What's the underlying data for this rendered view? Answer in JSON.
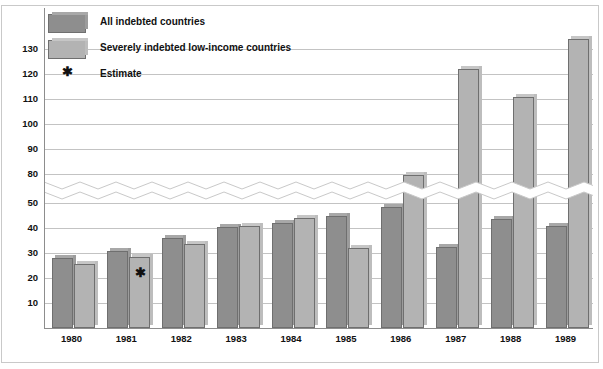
{
  "chart_data": {
    "type": "bar",
    "title": "",
    "subtitle": "",
    "xlabel": "",
    "ylabel": "",
    "categories": [
      "1980",
      "1981",
      "1982",
      "1983",
      "1984",
      "1985",
      "1986",
      "1987",
      "1988",
      "1989"
    ],
    "series": [
      {
        "name": "All indebted countries",
        "color": "#8e8e8e",
        "values": [
          28,
          31,
          36,
          40.5,
          42,
          45,
          48.5,
          51,
          43.5,
          41
        ]
      },
      {
        "name": "Severely indebted low-income countries",
        "color": "#b3b3b3",
        "values": [
          25.5,
          28.5,
          33.5,
          41,
          44,
          50.5,
          79.5,
          122,
          111,
          134
        ]
      }
    ],
    "ytick_labels": [
      "10",
      "20",
      "30",
      "40",
      "50",
      "80",
      "90",
      "100",
      "110",
      "120",
      "130"
    ],
    "ytick_values": [
      10,
      20,
      30,
      40,
      50,
      80,
      90,
      100,
      110,
      120,
      130
    ],
    "axis_break": {
      "present": true,
      "from": 50,
      "to": 80,
      "style": "zigzag"
    },
    "ylim": [
      0,
      137
    ],
    "grid": true,
    "legend_position": "top-left",
    "annotations": [
      {
        "label": "Estimate",
        "marker": "*",
        "series": "Severely indebted low-income countries",
        "category": "1981"
      }
    ]
  },
  "legend": {
    "items": [
      {
        "label": "All indebted countries",
        "swatch": "dark-gray-swatch"
      },
      {
        "label": "Severely indebted low-income countries",
        "swatch": "light-gray-swatch"
      },
      {
        "label": "Estimate",
        "swatch": "asterisk-marker"
      }
    ]
  },
  "colors": {
    "series_all_indebted": "#8e8e8e",
    "series_severely_indebted": "#b3b3b3",
    "gridline": "#c3c3c3",
    "axis": "#8d8d8d",
    "text": "#111111",
    "background": "#ffffff"
  }
}
